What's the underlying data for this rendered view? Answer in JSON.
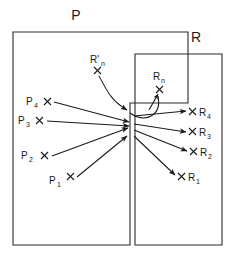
{
  "figure": {
    "type": "set-mapping-diagram",
    "background_color": "#ffffff",
    "stroke_color": "#1a1a1a",
    "boundary_color": "#2b2b2b",
    "sets": [
      {
        "id": "P",
        "label": "P",
        "label_x": 76,
        "label_y": 20,
        "shape": "stepped-rectangle",
        "path": "M 13 32 L 188 32 L 188 103 L 130 103 L 130 245 L 13 245 Z"
      },
      {
        "id": "R",
        "label": "R",
        "label_x": 196,
        "label_y": 42,
        "shape": "rectangle",
        "path": "M 135 54 L 222 54 L 222 245 L 135 245 Z"
      }
    ],
    "points": [
      {
        "id": "P4",
        "base": "P",
        "sub": "4",
        "x": 48,
        "y": 102,
        "label_x": 26,
        "label_y": 105,
        "marker_x": 47,
        "marker_y": 101
      },
      {
        "id": "P3",
        "base": "P",
        "sub": "3",
        "x": 40,
        "y": 120,
        "label_x": 19,
        "label_y": 123,
        "marker_x": 39,
        "marker_y": 119
      },
      {
        "id": "P2",
        "base": "P",
        "sub": "2",
        "x": 45,
        "y": 155,
        "label_x": 21,
        "label_y": 158,
        "marker_x": 44,
        "marker_y": 154
      },
      {
        "id": "P1",
        "base": "P",
        "sub": "1",
        "x": 71,
        "y": 178,
        "label_x": 48,
        "label_y": 184,
        "marker_x": 70,
        "marker_y": 177
      },
      {
        "id": "R4",
        "base": "R",
        "sub": "4",
        "x": 192,
        "y": 113,
        "label_x": 199,
        "label_y": 117,
        "marker_x": 192,
        "marker_y": 113
      },
      {
        "id": "R3",
        "base": "R",
        "sub": "3",
        "x": 192,
        "y": 133,
        "label_x": 199,
        "label_y": 137,
        "marker_x": 192,
        "marker_y": 133
      },
      {
        "id": "R2",
        "base": "R",
        "sub": "2",
        "x": 193,
        "y": 153,
        "label_x": 200,
        "label_y": 157,
        "marker_x": 193,
        "marker_y": 153
      },
      {
        "id": "R1",
        "base": "R",
        "sub": "1",
        "x": 181,
        "y": 178,
        "label_x": 188,
        "label_y": 182,
        "marker_x": 181,
        "marker_y": 178
      },
      {
        "id": "Rn",
        "base": "R",
        "sub": "n",
        "x": 159,
        "y": 89,
        "label_x": 156,
        "label_y": 78,
        "marker_x": 159,
        "marker_y": 89
      },
      {
        "id": "Rprime_n",
        "base": "R'",
        "sub": "n",
        "x": 97,
        "y": 70,
        "label_x": 92,
        "label_y": 62,
        "marker_x": 97,
        "marker_y": 70
      }
    ],
    "convergence_point": {
      "x": 131,
      "y": 118
    },
    "arrows_in": [
      {
        "from": "P4",
        "to": "convergence",
        "path": "M 54 102 L 129 122"
      },
      {
        "from": "P3",
        "to": "convergence",
        "path": "M 47 121 L 129 126"
      },
      {
        "from": "P2",
        "to": "convergence",
        "path": "M 52 156 L 128 128"
      },
      {
        "from": "P1",
        "to": "convergence",
        "path": "M 77 177 L 126 137"
      }
    ],
    "arrows_out": [
      {
        "from": "convergence",
        "to": "R4",
        "path": "M 133 116 L 188 112"
      },
      {
        "from": "convergence",
        "to": "R3",
        "path": "M 133 124 L 188 132"
      },
      {
        "from": "convergence",
        "to": "R2",
        "path": "M 133 130 L 189 152"
      },
      {
        "from": "convergence",
        "to": "R1",
        "path": "M 133 136 L 176 176"
      }
    ],
    "curves": [
      {
        "id": "Rprime-n-curve",
        "from": "Rprime_n",
        "to": "neck-top",
        "path": "M 99 76 C 107 92 112 100 128 109"
      },
      {
        "id": "Rn-curve",
        "from": "neck",
        "to": "Rn-return",
        "path": "M 129 114 C 145 122 160 112 158 95"
      },
      {
        "id": "Rn-arrow",
        "from": "neck-right",
        "to": "Rn",
        "path": "M 150 109 L 158 93"
      }
    ]
  }
}
